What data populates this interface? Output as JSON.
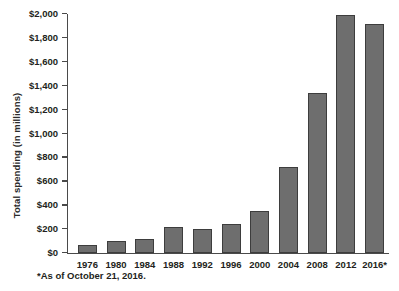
{
  "figure": {
    "partial_top_text": "",
    "footnote": "*As of October 21, 2016."
  },
  "chart_data": {
    "type": "bar",
    "title": "",
    "xlabel": "",
    "ylabel": "Total spending (in millions)",
    "categories": [
      "1976",
      "1980",
      "1984",
      "1988",
      "1992",
      "1996",
      "2000",
      "2004",
      "2008",
      "2012",
      "2016*"
    ],
    "values": [
      70,
      100,
      115,
      220,
      200,
      240,
      350,
      720,
      1340,
      1990,
      1920
    ],
    "ylim": [
      0,
      2000
    ],
    "yticks": [
      0,
      200,
      400,
      600,
      800,
      1000,
      1200,
      1400,
      1600,
      1800,
      2000
    ],
    "ytick_labels": [
      "$0",
      "$200",
      "$400",
      "$600",
      "$800",
      "$1,000",
      "$1,200",
      "$1,400",
      "$1,600",
      "$1,800",
      "$2,000"
    ],
    "grid": false,
    "legend": null,
    "bar_color": "#6e6e6e",
    "bar_edge_color": "#3d3d3d",
    "axis_color": "#4a4a4a"
  }
}
